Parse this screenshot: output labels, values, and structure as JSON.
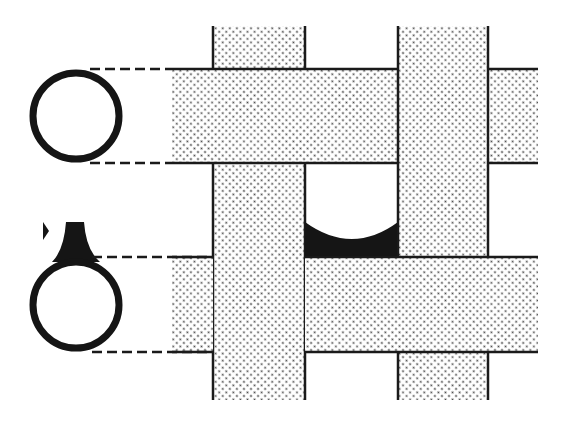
{
  "diagram": {
    "type": "woven-fiber-cross-section",
    "colors": {
      "background": "#ffffff",
      "stroke": "#1a1a1a",
      "fill_dots": "#555555",
      "fillet": "#151515"
    },
    "vertical_strands": [
      {
        "x": 213,
        "width": 92,
        "y_top": 26,
        "y_bottom": 400
      },
      {
        "x": 398,
        "width": 90,
        "y_top": 26,
        "y_bottom": 400
      }
    ],
    "horizontal_strands": [
      {
        "y": 69,
        "height": 94,
        "x_left": 172,
        "x_right": 538
      },
      {
        "y": 257,
        "height": 95,
        "x_left": 172,
        "x_right": 538
      }
    ],
    "cross_sections": [
      {
        "cx": 76,
        "cy": 116,
        "r": 44,
        "fillet": false
      },
      {
        "cx": 76,
        "cy": 305,
        "r": 44,
        "fillet": true
      }
    ]
  }
}
